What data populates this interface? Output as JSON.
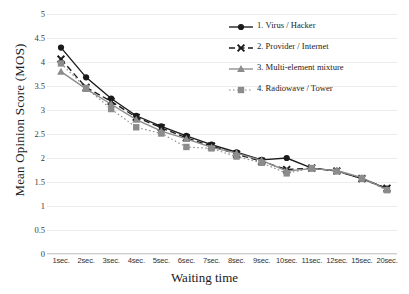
{
  "chart_data": {
    "type": "line",
    "title": "",
    "xlabel": "Waiting time",
    "ylabel": "Mean Opinion Score (MOS)",
    "categories": [
      "1sec.",
      "2sec.",
      "3sec.",
      "4sec.",
      "5sec.",
      "6sec.",
      "7sec.",
      "8sec.",
      "9sec.",
      "10sec.",
      "11sec.",
      "12sec.",
      "15sec.",
      "20sec."
    ],
    "ylim": [
      0,
      5
    ],
    "ytick_step": 0.5,
    "yticks": [
      "5",
      "4.5",
      "4",
      "3.5",
      "3",
      "2.5",
      "2",
      "1.5",
      "1",
      "0.5",
      "0"
    ],
    "grid": true,
    "grid_axis": "y",
    "legend_position": "upper-right",
    "series": [
      {
        "name": "1. Virus / Hacker",
        "color": "#1a1a1a",
        "marker": "circle",
        "dash": "solid",
        "values": [
          4.3,
          3.68,
          3.24,
          2.88,
          2.66,
          2.46,
          2.28,
          2.12,
          1.96,
          2.0,
          1.79,
          1.73,
          1.57,
          1.36
        ]
      },
      {
        "name": "2. Provider / Internet",
        "color": "#1a1a1a",
        "marker": "x",
        "dash": "dashed",
        "values": [
          4.06,
          3.47,
          3.18,
          2.85,
          2.63,
          2.42,
          2.25,
          2.08,
          1.93,
          1.76,
          1.79,
          1.73,
          1.57,
          1.37
        ]
      },
      {
        "name": "3. Multi-element mixture",
        "color": "#8c8c8c",
        "marker": "triangle",
        "dash": "solid",
        "values": [
          3.8,
          3.44,
          3.12,
          2.8,
          2.56,
          2.4,
          2.22,
          2.1,
          1.95,
          1.73,
          1.78,
          1.74,
          1.59,
          1.34
        ]
      },
      {
        "name": "4. Radiowave / Tower",
        "color": "#8c8c8c",
        "marker": "square",
        "dash": "dotted",
        "values": [
          3.97,
          3.46,
          3.02,
          2.64,
          2.51,
          2.23,
          2.2,
          2.03,
          1.9,
          1.68,
          1.79,
          1.72,
          1.57,
          1.33
        ]
      }
    ]
  },
  "legend": {
    "items": [
      {
        "label": "1. Virus / Hacker"
      },
      {
        "label": "2. Provider / Internet"
      },
      {
        "label": "3. Multi-element mixture"
      },
      {
        "label": "4. Radiowave / Tower"
      }
    ]
  }
}
